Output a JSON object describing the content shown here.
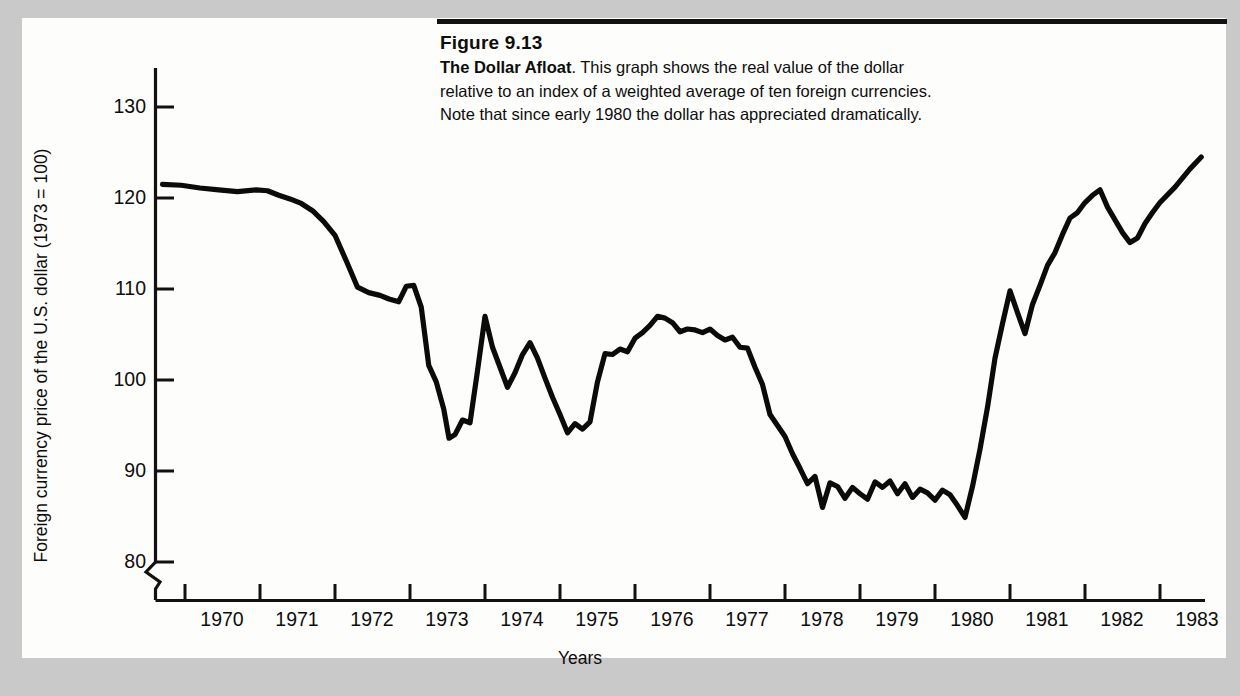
{
  "figure": {
    "number": "Figure 9.13",
    "title_bold": "The Dollar Afloat",
    "caption_line1": ". This graph shows the real value of the dollar",
    "caption_line2": "relative to an index of a weighted average of ten foreign currencies.",
    "caption_line3": "Note that since early 1980 the dollar has appreciated dramatically.",
    "rule_color": "#111111",
    "panel_color": "#fdfdfb",
    "page_background": "#c9c9c9",
    "ink_color": "#0b0b0b"
  },
  "chart_data": {
    "type": "line",
    "title": "The Dollar Afloat",
    "xlabel": "Years",
    "ylabel": "Foreign currency price of the U.S. dollar (1973 = 100)",
    "xlim": [
      1969.6,
      1983.6
    ],
    "ylim": [
      78,
      133
    ],
    "yaxis_break": true,
    "yaxis_break_note": "axis broken below 80",
    "grid": false,
    "legend": "none",
    "xticks": [
      1970,
      1971,
      1972,
      1973,
      1974,
      1975,
      1976,
      1977,
      1978,
      1979,
      1980,
      1981,
      1982,
      1983
    ],
    "xtick_labels": [
      "1970",
      "1971",
      "1972",
      "1973",
      "1974",
      "1975",
      "1976",
      "1977",
      "1978",
      "1979",
      "1980",
      "1981",
      "1982",
      "1983"
    ],
    "yticks": [
      80,
      90,
      100,
      110,
      120,
      130
    ],
    "ytick_labels": [
      "80",
      "90",
      "100",
      "110",
      "120",
      "130"
    ],
    "series": [
      {
        "name": "Real trade-weighted value of the U.S. dollar",
        "x": [
          1969.7,
          1969.95,
          1970.2,
          1970.45,
          1970.7,
          1970.95,
          1971.1,
          1971.25,
          1971.4,
          1971.55,
          1971.7,
          1971.85,
          1972.0,
          1972.15,
          1972.3,
          1972.45,
          1972.6,
          1972.72,
          1972.85,
          1972.95,
          1973.05,
          1973.15,
          1973.25,
          1973.35,
          1973.45,
          1973.52,
          1973.6,
          1973.7,
          1973.8,
          1973.9,
          1974.0,
          1974.1,
          1974.2,
          1974.3,
          1974.4,
          1974.5,
          1974.6,
          1974.7,
          1974.8,
          1974.9,
          1975.0,
          1975.1,
          1975.2,
          1975.3,
          1975.4,
          1975.5,
          1975.6,
          1975.7,
          1975.8,
          1975.9,
          1976.0,
          1976.1,
          1976.2,
          1976.3,
          1976.4,
          1976.5,
          1976.6,
          1976.7,
          1976.8,
          1976.9,
          1977.0,
          1977.1,
          1977.2,
          1977.3,
          1977.4,
          1977.5,
          1977.6,
          1977.7,
          1977.8,
          1977.9,
          1978.0,
          1978.1,
          1978.2,
          1978.3,
          1978.4,
          1978.5,
          1978.6,
          1978.7,
          1978.8,
          1978.9,
          1979.0,
          1979.1,
          1979.2,
          1979.3,
          1979.4,
          1979.5,
          1979.6,
          1979.7,
          1979.8,
          1979.9,
          1980.0,
          1980.1,
          1980.2,
          1980.3,
          1980.4,
          1980.5,
          1980.6,
          1980.7,
          1980.8,
          1980.9,
          1981.0,
          1981.1,
          1981.2,
          1981.3,
          1981.4,
          1981.5,
          1981.6,
          1981.7,
          1981.8,
          1981.9,
          1982.0,
          1982.1,
          1982.2,
          1982.3,
          1982.4,
          1982.5,
          1982.6,
          1982.7,
          1982.8,
          1982.9,
          1983.0,
          1983.2,
          1983.4,
          1983.55
        ],
        "y": [
          121.5,
          121.4,
          121.1,
          120.9,
          120.7,
          120.9,
          120.8,
          120.3,
          119.9,
          119.4,
          118.6,
          117.4,
          115.9,
          113.1,
          110.2,
          109.6,
          109.3,
          108.9,
          108.6,
          110.3,
          110.4,
          108.0,
          101.6,
          99.8,
          96.8,
          93.6,
          94.0,
          95.6,
          95.3,
          101.0,
          107.0,
          103.6,
          101.4,
          99.2,
          100.8,
          102.8,
          104.1,
          102.4,
          100.2,
          98.1,
          96.2,
          94.2,
          95.2,
          94.6,
          95.4,
          99.8,
          102.9,
          102.8,
          103.4,
          103.1,
          104.6,
          105.2,
          106.0,
          107.0,
          106.8,
          106.3,
          105.3,
          105.6,
          105.5,
          105.2,
          105.6,
          104.9,
          104.4,
          104.7,
          103.6,
          103.5,
          101.4,
          99.5,
          96.2,
          95.0,
          93.8,
          91.9,
          90.3,
          88.6,
          89.4,
          86.0,
          88.7,
          88.3,
          87.0,
          88.2,
          87.5,
          86.9,
          88.8,
          88.2,
          88.9,
          87.5,
          88.6,
          87.1,
          88.0,
          87.6,
          86.8,
          87.9,
          87.4,
          86.2,
          84.9,
          88.3,
          92.4,
          97.0,
          102.4,
          106.2,
          109.8,
          107.4,
          105.1,
          108.3,
          110.4,
          112.6,
          114.0,
          116.0,
          117.8,
          118.4,
          119.5,
          120.3,
          120.9,
          119.0,
          117.6,
          116.2,
          115.1,
          115.6,
          117.2,
          118.4,
          119.5,
          121.2,
          123.2,
          124.5
        ]
      }
    ],
    "annotations": [
      {
        "text": "peak early 1970",
        "value": 121.5
      },
      {
        "text": "trough mid 1980",
        "value": 84.9
      },
      {
        "text": "end 1983",
        "value": 124.5
      }
    ]
  },
  "axes": {
    "x_title": "Years",
    "y_title": "Foreign currency price of the U.S. dollar (1973 = 100)"
  }
}
